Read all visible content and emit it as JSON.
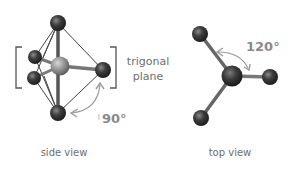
{
  "diagram": {
    "labels": {
      "trigonal_line1": "trigonal",
      "trigonal_line2": "plane",
      "side_angle": "90°",
      "top_angle": "120°",
      "side_caption": "side view",
      "top_caption": "top view"
    },
    "colors": {
      "atom_dark": "#3a3a3a",
      "atom_center": "#9a9a9a",
      "bond": "#555555",
      "bracket": "#555555",
      "arrow": "#9a9a9a",
      "text": "#6e6e6e"
    }
  }
}
